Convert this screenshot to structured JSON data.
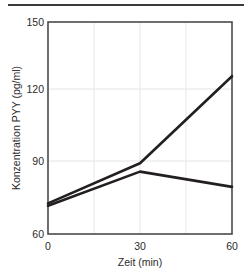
{
  "chart_data": {
    "type": "line",
    "title": "",
    "xlabel": "Zeit (min)",
    "ylabel": "Konzentration  PYY (pg/ml)",
    "x": [
      0,
      30,
      60
    ],
    "xlim": [
      0,
      60
    ],
    "ylim": [
      60,
      150
    ],
    "xticks": [
      "0",
      "30",
      "60"
    ],
    "yticks": [
      "60",
      "90",
      "120",
      "150"
    ],
    "grid": true,
    "legend": "none",
    "series": [
      {
        "name": "series-rising",
        "values": [
          73,
          90,
          127
        ],
        "color": "#231f20"
      },
      {
        "name": "series-peak",
        "values": [
          72,
          86.5,
          80
        ],
        "color": "#231f20"
      }
    ]
  },
  "axes": {
    "y_tick_150": "150",
    "y_tick_120": "120",
    "y_tick_90": "90",
    "y_tick_60": "60",
    "x_tick_0": "0",
    "x_tick_30": "30",
    "x_tick_60": "60",
    "y_axis_title": "Konzentration  PYY (pg/ml)",
    "x_axis_title": "Zeit (min)"
  },
  "style": {
    "line_color": "#231f20",
    "axis_color": "#4a4a4a",
    "grid_color": "#e4e4e8",
    "rule_color": "#3a3a3a"
  }
}
